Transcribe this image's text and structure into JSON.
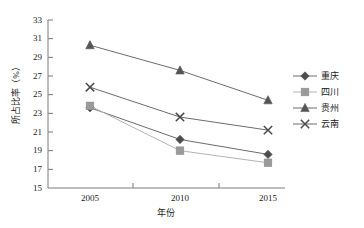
{
  "chart_data": {
    "type": "line",
    "title": "",
    "xlabel": "年份",
    "ylabel": "所占比率（%）",
    "categories": [
      "2005",
      "2010",
      "2015"
    ],
    "x": [
      2005,
      2010,
      2015
    ],
    "xlim": [
      2002.5,
      2017.5
    ],
    "ylim": [
      15,
      33
    ],
    "ytick_labels": [
      "15",
      "17",
      "19",
      "21",
      "23",
      "25",
      "27",
      "29",
      "31",
      "33"
    ],
    "yticks": [
      15,
      17,
      19,
      21,
      23,
      25,
      27,
      29,
      31,
      33
    ],
    "xtick_labels": [
      "2005",
      "2010",
      "2015"
    ],
    "grid": false,
    "legend_position": "right",
    "series": [
      {
        "name": "重庆",
        "marker": "diamond",
        "color": "#4d4d4d",
        "line_color": "#6b6b6b",
        "values": [
          23.6,
          20.2,
          18.6
        ]
      },
      {
        "name": "四川",
        "marker": "square",
        "color": "#9a9a9a",
        "line_color": "#b4b4b4",
        "values": [
          23.8,
          19.0,
          17.7
        ]
      },
      {
        "name": "贵州",
        "marker": "triangle",
        "color": "#555555",
        "line_color": "#6b6b6b",
        "values": [
          30.3,
          27.6,
          24.4
        ]
      },
      {
        "name": "云南",
        "marker": "cross",
        "color": "#4a4a4a",
        "line_color": "#6b6b6b",
        "values": [
          25.8,
          22.6,
          21.2
        ]
      }
    ]
  },
  "axis": {
    "y_title": "所占比率（%）",
    "x_title": "年份",
    "y_tick_0": "15",
    "y_tick_1": "17",
    "y_tick_2": "19",
    "y_tick_3": "21",
    "y_tick_4": "23",
    "y_tick_5": "25",
    "y_tick_6": "27",
    "y_tick_7": "29",
    "y_tick_8": "31",
    "y_tick_9": "33",
    "x_tick_0": "2005",
    "x_tick_1": "2010",
    "x_tick_2": "2015"
  },
  "legend": {
    "items": [
      {
        "label": "重庆",
        "marker": "diamond-marker"
      },
      {
        "label": "四川",
        "marker": "square-marker"
      },
      {
        "label": "贵州",
        "marker": "triangle-marker"
      },
      {
        "label": "云南",
        "marker": "cross-marker"
      }
    ]
  },
  "colors": {
    "axis": "#7a7a7a",
    "text": "#1a1a1a",
    "series_chongqing": "#4d4d4d",
    "series_sichuan": "#9a9a9a",
    "series_guizhou": "#555555",
    "series_yunnan": "#4a4a4a",
    "background": "#ffffff"
  }
}
